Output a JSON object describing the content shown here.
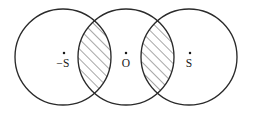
{
  "figure": {
    "background_color": "#ffffff",
    "stroke_color": "#2a2a2a",
    "hatch_color": "#3a3a3a",
    "label_color": "#1a1a1a",
    "width": 253,
    "height": 116
  },
  "circles": [
    {
      "id": "left-circle",
      "cx": 63,
      "cy": 57,
      "r": 48
    },
    {
      "id": "center-circle",
      "cx": 126,
      "cy": 57,
      "r": 48
    },
    {
      "id": "right-circle",
      "cx": 189,
      "cy": 57,
      "r": 48
    }
  ],
  "overlaps": [
    {
      "id": "left-lens",
      "between": "left-circle / center-circle",
      "hatched": true,
      "hatch_direction": "diagonal-up-right"
    },
    {
      "id": "right-lens",
      "between": "center-circle / right-circle",
      "hatched": true,
      "hatch_direction": "diagonal-up-right"
    }
  ],
  "labels": [
    {
      "id": "label-left",
      "text": "−S",
      "dot": "·",
      "x": 63,
      "y": 67,
      "dot_x": 64,
      "dot_y": 53
    },
    {
      "id": "label-center",
      "text": "O",
      "dot": "·",
      "x": 126,
      "y": 67,
      "dot_x": 126,
      "dot_y": 53
    },
    {
      "id": "label-right",
      "text": "S",
      "dot": "·",
      "x": 189,
      "y": 67,
      "dot_x": 190,
      "dot_y": 53
    }
  ],
  "label_text": {
    "left": "−S",
    "center": "O",
    "right": "S"
  }
}
